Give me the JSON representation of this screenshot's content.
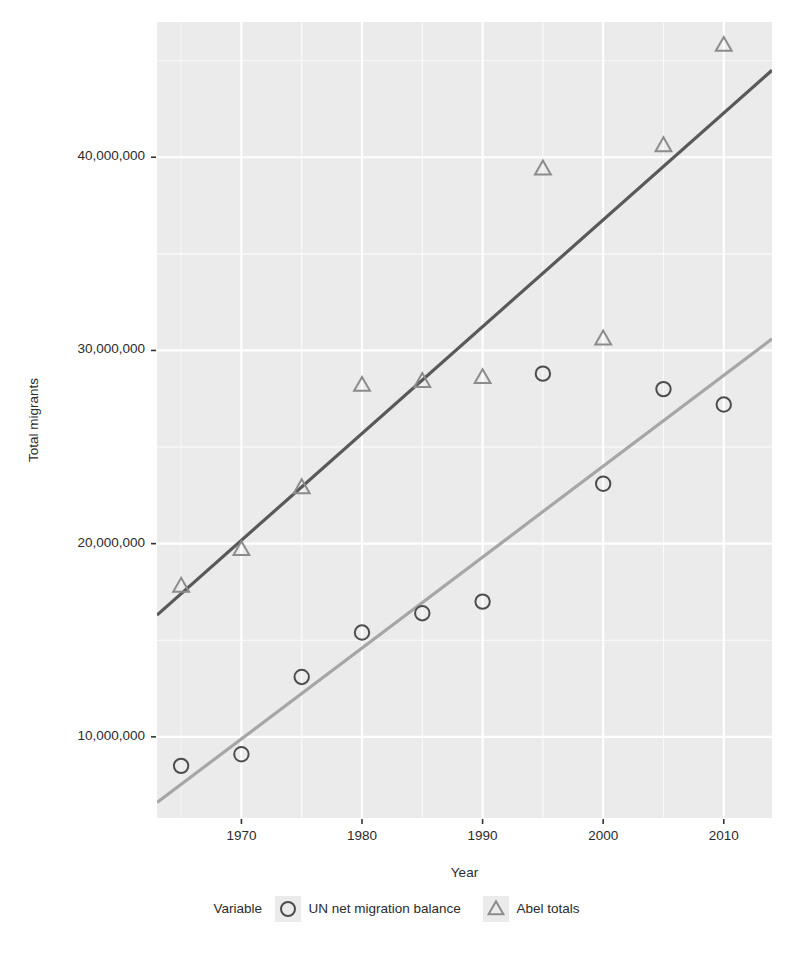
{
  "chart_data": {
    "type": "scatter",
    "title": "",
    "xlabel": "Year",
    "ylabel": "Total migrants",
    "xlim": [
      1963,
      2014
    ],
    "ylim": [
      5800000,
      47000000
    ],
    "xticks": [
      1970,
      1980,
      1990,
      2000,
      2010
    ],
    "xticklabels": [
      "1970",
      "1980",
      "1990",
      "2000",
      "2010"
    ],
    "yticks": [
      10000000,
      20000000,
      30000000,
      40000000
    ],
    "yticklabels": [
      "10,000,000",
      "20,000,000",
      "30,000,000",
      "40,000,000"
    ],
    "grid": true,
    "panel_background": "#EBEBEB",
    "gridline_color": "#FFFFFF",
    "legend": {
      "title": "Variable",
      "position": "bottom",
      "entries": [
        {
          "label": "UN net migration balance",
          "marker": "circle",
          "color": "#4D4D4D"
        },
        {
          "label": "Abel totals",
          "marker": "triangle",
          "color": "#8C8C8C"
        }
      ]
    },
    "x": [
      1965,
      1970,
      1975,
      1980,
      1985,
      1990,
      1995,
      2000,
      2005,
      2010
    ],
    "series": [
      {
        "name": "UN net migration balance",
        "marker": "circle",
        "color": "#4D4D4D",
        "values": [
          8500000,
          9100000,
          13100000,
          15400000,
          16400000,
          17000000,
          28800000,
          23100000,
          28000000,
          27200000
        ],
        "trend": {
          "x0": 1963,
          "y0": 6600000,
          "x1": 2014,
          "y1": 30600000,
          "color": "#A6A6A6"
        }
      },
      {
        "name": "Abel totals",
        "marker": "triangle",
        "color": "#8C8C8C",
        "values": [
          17800000,
          19700000,
          22900000,
          28200000,
          28400000,
          28600000,
          39400000,
          30600000,
          40600000,
          45800000
        ],
        "trend": {
          "x0": 1963,
          "y0": 16300000,
          "x1": 2014,
          "y1": 44500000,
          "color": "#595959"
        }
      }
    ]
  }
}
